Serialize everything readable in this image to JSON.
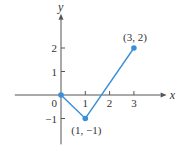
{
  "chart_data": {
    "type": "line",
    "title": "",
    "xlabel": "x",
    "ylabel": "y",
    "xlim": [
      -1.9,
      4.1
    ],
    "ylim": [
      -2.1,
      3.2
    ],
    "x_ticks": [
      1,
      2,
      3
    ],
    "y_ticks": [
      -1,
      1,
      2
    ],
    "origin_label": "0",
    "grid": false,
    "series": [
      {
        "name": "piecewise-linear",
        "color": "#3a8fd8",
        "points": [
          {
            "x": 0,
            "y": 0
          },
          {
            "x": 1,
            "y": -1
          },
          {
            "x": 3,
            "y": 2
          }
        ]
      }
    ],
    "point_labels": [
      {
        "x": 1,
        "y": -1,
        "text": "(1, −1)",
        "position": "below"
      },
      {
        "x": 3,
        "y": 2,
        "text": "(3, 2)",
        "position": "above"
      }
    ],
    "colors": {
      "axis": "#555555",
      "series": "#3a8fd8",
      "text": "#333333"
    }
  }
}
